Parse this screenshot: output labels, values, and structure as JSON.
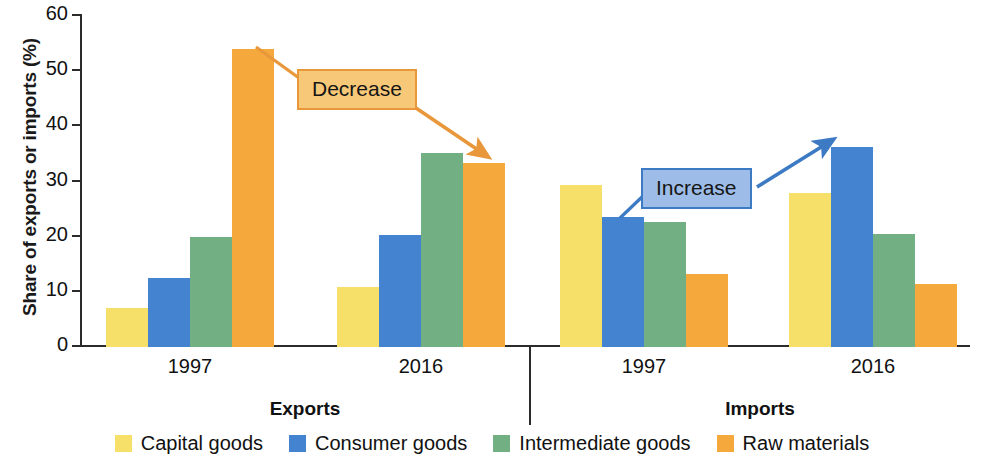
{
  "chart_data": {
    "type": "bar",
    "title": "",
    "xlabel": "",
    "ylabel": "Share of exports or imports (%)",
    "ylim": [
      0,
      60
    ],
    "yticks": [
      0,
      10,
      20,
      30,
      40,
      50,
      60
    ],
    "grid": false,
    "legend_position": "bottom",
    "panels": [
      {
        "name": "Exports",
        "categories": [
          "1997",
          "2016"
        ]
      },
      {
        "name": "Imports",
        "categories": [
          "1997",
          "2016"
        ]
      }
    ],
    "categories": [
      "Exports 1997",
      "Exports 2016",
      "Imports 1997",
      "Imports 2016"
    ],
    "series": [
      {
        "name": "Capital goods",
        "color": "#f7e06a",
        "values": [
          7.1,
          10.9,
          29.3,
          28.0
        ]
      },
      {
        "name": "Consumer goods",
        "color": "#4483cf",
        "values": [
          12.5,
          20.3,
          23.6,
          36.3
        ]
      },
      {
        "name": "Intermediate goods",
        "color": "#72b083",
        "values": [
          20.0,
          35.1,
          22.7,
          20.4
        ]
      },
      {
        "name": "Raw materials",
        "color": "#f5a93c",
        "values": [
          54.0,
          33.3,
          13.2,
          11.4
        ]
      }
    ],
    "annotations": [
      {
        "label": "Decrease",
        "fill": "#f8c879",
        "border": "#e8973a",
        "arrow_color": "#e8973a",
        "from": "Exports 1997 Raw materials",
        "to": "Exports 2016 Raw materials"
      },
      {
        "label": "Increase",
        "fill": "#9dbde8",
        "border": "#3d7ac4",
        "arrow_color": "#3d7ac4",
        "from": "Imports 1997 Consumer goods",
        "to": "Imports 2016 Consumer goods"
      }
    ]
  },
  "axis": {
    "y_title": "Share of exports or imports (%)",
    "ticks": [
      "60",
      "50",
      "40",
      "30",
      "20",
      "10",
      "0"
    ]
  },
  "groups": [
    {
      "label": "Exports",
      "years": [
        "1997",
        "2016"
      ]
    },
    {
      "label": "Imports",
      "years": [
        "1997",
        "2016"
      ]
    }
  ],
  "annotations": {
    "decrease": "Decrease",
    "increase": "Increase"
  },
  "legend": [
    {
      "label": "Capital goods",
      "color": "#f7e06a"
    },
    {
      "label": "Consumer goods",
      "color": "#4483cf"
    },
    {
      "label": "Intermediate goods",
      "color": "#72b083"
    },
    {
      "label": "Raw materials",
      "color": "#f5a93c"
    }
  ]
}
